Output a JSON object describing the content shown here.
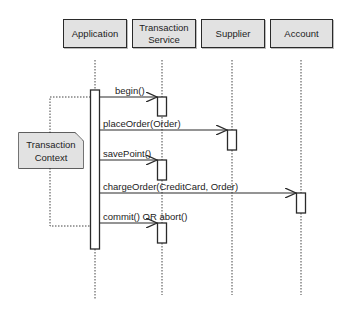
{
  "diagram": {
    "type": "uml-sequence-diagram",
    "participants": [
      {
        "id": "application",
        "label": "Application"
      },
      {
        "id": "transaction_service",
        "label": "Transaction\nService"
      },
      {
        "id": "supplier",
        "label": "Supplier"
      },
      {
        "id": "account",
        "label": "Account"
      }
    ],
    "messages": [
      {
        "from": "application",
        "to": "transaction_service",
        "label": "begin()"
      },
      {
        "from": "application",
        "to": "supplier",
        "label": "placeOrder(Order)"
      },
      {
        "from": "application",
        "to": "transaction_service",
        "label": "savePoint()"
      },
      {
        "from": "application",
        "to": "account",
        "label": "chargeOrder(CreditCard, Order)"
      },
      {
        "from": "application",
        "to": "transaction_service",
        "label": "commit() OR abort()"
      }
    ],
    "note": {
      "label": "Transaction\nContext",
      "attached_to": "application",
      "spans_messages": [
        "begin()",
        "commit() OR abort()"
      ]
    },
    "colors": {
      "box_fill": "#e2e2e2",
      "line": "#2a2a2a",
      "background": "#ffffff"
    }
  }
}
